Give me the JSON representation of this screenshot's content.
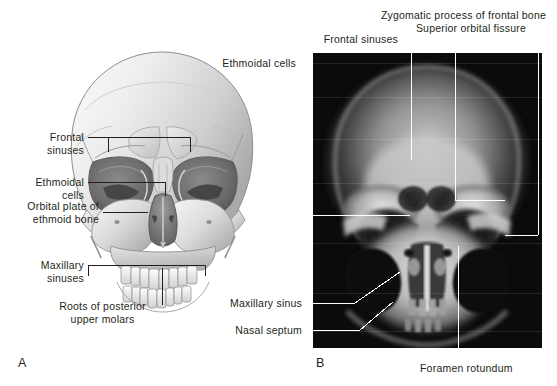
{
  "figure": {
    "panels": [
      {
        "letter": "A",
        "name": "anatomical-illustration-skull-anterior"
      },
      {
        "letter": "B",
        "name": "radiograph-skull-occipitofrontal"
      }
    ],
    "left_labels": [
      {
        "id": "frontal-sinuses-left",
        "text": "Frontal\nsinuses"
      },
      {
        "id": "ethmoidal-cells-left",
        "text": "Ethmoidal\ncells"
      },
      {
        "id": "orbital-plate-ethmoid-bone",
        "text": "Orbital plate of\nethmoid bone"
      },
      {
        "id": "maxillary-sinuses-left",
        "text": "Maxillary\nsinuses"
      },
      {
        "id": "roots-posterior-upper-molars",
        "text": "Roots of posterior\nupper molars"
      }
    ],
    "top_labels": [
      {
        "id": "ethmoidal-cells-top",
        "text": "Ethmoidal cells"
      },
      {
        "id": "frontal-sinuses-top",
        "text": "Frontal sinuses"
      },
      {
        "id": "zygomatic-process-frontal-bone",
        "text": "Zygomatic process of frontal bone"
      },
      {
        "id": "superior-orbital-fissure",
        "text": "Superior orbital fissure"
      }
    ],
    "xray_labels": [
      {
        "id": "maxillary-sinus",
        "text": "Maxillary sinus"
      },
      {
        "id": "nasal-septum",
        "text": "Nasal septum"
      },
      {
        "id": "foramen-rotundum",
        "text": "Foramen rotundum"
      }
    ],
    "caption": "",
    "colors": {
      "text": "#231f20",
      "leader_dark": "#231f20",
      "leader_light": "#ffffff",
      "xray_background": "#0a0a0a",
      "page_background": "#ffffff"
    }
  }
}
